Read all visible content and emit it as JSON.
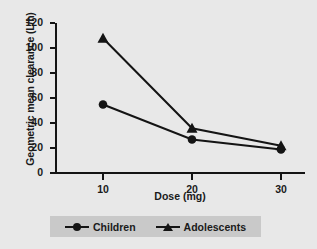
{
  "chart_data": {
    "type": "line",
    "title": "",
    "xlabel": "Dose (mg)",
    "ylabel": "Geometric mean clearance (L/h)",
    "x": [
      10,
      20,
      30
    ],
    "xtick_labels": [
      "10",
      "20",
      "30"
    ],
    "ytick_labels": [
      "0",
      "20",
      "40",
      "60",
      "80",
      "100",
      "120"
    ],
    "ytick_values": [
      0,
      20,
      40,
      60,
      80,
      100,
      120
    ],
    "xlim": [
      5,
      33
    ],
    "ylim": [
      0,
      120
    ],
    "grid": false,
    "legend_position": "bottom",
    "series": [
      {
        "name": "Children",
        "marker": "circle",
        "color": "#141414",
        "values": [
          54,
          26,
          18
        ]
      },
      {
        "name": "Adolescents",
        "marker": "triangle",
        "color": "#141414",
        "values": [
          107,
          35,
          21
        ]
      }
    ]
  },
  "legend": {
    "items": [
      {
        "label": "Children",
        "marker": "circle"
      },
      {
        "label": "Adolescents",
        "marker": "triangle"
      }
    ]
  },
  "colors": {
    "background": "#e8e8e8",
    "axis": "#141414",
    "text": "#1a1a1a",
    "legend_background": "#c9c9c9"
  }
}
